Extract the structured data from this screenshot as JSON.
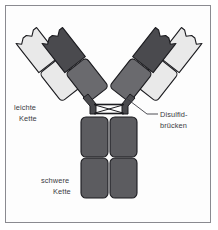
{
  "figure": {
    "type": "antibody-structure-diagram",
    "background_color": "#fdfdfd",
    "frame_color": "#8a8a90"
  },
  "colors": {
    "light_chain_fill": "#e9e9e9",
    "heavy_chain_dark_fill": "#4a4a4e",
    "heavy_chain_mid_fill": "#6a6a6e",
    "heavy_chain_stem_fill": "#5c5c60",
    "outline": "#1b1b1f",
    "label_text": "#3a3a42",
    "leader_line": "#3a3a42"
  },
  "labels": {
    "light_chain": {
      "line1": "leichte",
      "line2": "Kette"
    },
    "disulfide": {
      "line1": "Disulfid-",
      "line2": "brücken"
    },
    "heavy_chain": {
      "line1": "schwere",
      "line2": "Kette"
    }
  },
  "structure": {
    "arms": 2,
    "light_chain_domains_per_arm": 2,
    "heavy_chain_arm_domains_per_arm": 2,
    "stem_columns": 2,
    "stem_domains_per_column": 2,
    "disulfide_bridge_lines": 2,
    "antigen_binding_notches": 4
  }
}
